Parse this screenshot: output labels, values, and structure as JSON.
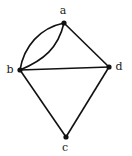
{
  "graph": {
    "vertices": [
      {
        "id": "a",
        "label": "a",
        "x": 64,
        "y": 23,
        "lx": 63,
        "ly": 11
      },
      {
        "id": "b",
        "label": "b",
        "x": 20,
        "y": 70,
        "lx": 10,
        "ly": 70
      },
      {
        "id": "d",
        "label": "d",
        "x": 109,
        "y": 67,
        "lx": 119,
        "ly": 67
      },
      {
        "id": "c",
        "label": "c",
        "x": 66,
        "y": 137,
        "lx": 65,
        "ly": 148
      }
    ],
    "edges": [
      {
        "from": "a",
        "to": "b",
        "type": "curve",
        "bulge": "outer"
      },
      {
        "from": "a",
        "to": "b",
        "type": "curve",
        "bulge": "inner"
      },
      {
        "from": "a",
        "to": "d",
        "type": "straight"
      },
      {
        "from": "b",
        "to": "d",
        "type": "straight"
      },
      {
        "from": "b",
        "to": "c",
        "type": "straight"
      },
      {
        "from": "d",
        "to": "c",
        "type": "straight"
      }
    ],
    "colors": {
      "stroke": "#111111",
      "label": "#222222",
      "background": "#ffffff"
    }
  }
}
